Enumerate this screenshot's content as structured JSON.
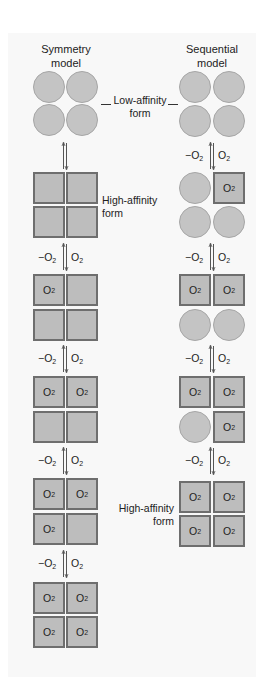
{
  "columns": [
    {
      "title_line1": "Symmetry",
      "title_line2": "model"
    },
    {
      "title_line1": "Sequential",
      "title_line2": "model"
    }
  ],
  "labels": {
    "low_affinity_line1": "Low-affinity",
    "low_affinity_line2": "form",
    "high_affinity_left_line1": "High-affinity",
    "high_affinity_left_line2": "form",
    "high_affinity_right_line1": "High-affinity",
    "high_affinity_right_line2": "form"
  },
  "reaction": {
    "release": "−O",
    "bind": "O",
    "subscript": "2"
  },
  "ligand": {
    "symbol": "O",
    "subscript": "2"
  },
  "colors": {
    "subunit_fill": "#bdbdbd",
    "subunit_border": "#6e6e6e",
    "circle_fill": "#c4c4c4",
    "panel_bg": "#f8f8f8"
  },
  "symmetry_model_states": [
    {
      "shape": "circle",
      "bound": [
        false,
        false,
        false,
        false
      ]
    },
    {
      "shape": "square",
      "bound": [
        false,
        false,
        false,
        false
      ]
    },
    {
      "shape": "square",
      "bound": [
        true,
        false,
        false,
        false
      ]
    },
    {
      "shape": "square",
      "bound": [
        true,
        true,
        false,
        false
      ]
    },
    {
      "shape": "square",
      "bound": [
        true,
        true,
        true,
        false
      ]
    },
    {
      "shape": "square",
      "bound": [
        true,
        true,
        true,
        true
      ]
    }
  ],
  "sequential_model_states": [
    {
      "shapes": [
        "circle",
        "circle",
        "circle",
        "circle"
      ],
      "bound": [
        false,
        false,
        false,
        false
      ]
    },
    {
      "shapes": [
        "circle",
        "square",
        "circle",
        "circle"
      ],
      "bound": [
        false,
        true,
        false,
        false
      ]
    },
    {
      "shapes": [
        "square",
        "square",
        "circle",
        "circle"
      ],
      "bound": [
        true,
        true,
        false,
        false
      ]
    },
    {
      "shapes": [
        "square",
        "square",
        "circle",
        "square"
      ],
      "bound": [
        true,
        true,
        false,
        true
      ]
    },
    {
      "shapes": [
        "square",
        "square",
        "square",
        "square"
      ],
      "bound": [
        true,
        true,
        true,
        true
      ]
    }
  ]
}
